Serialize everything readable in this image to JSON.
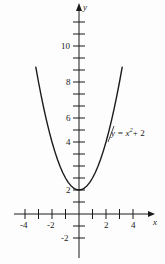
{
  "chart_data": {
    "type": "line",
    "title": "",
    "xlabel": "x",
    "ylabel": "y",
    "equation_label": "y = x",
    "equation_exponent": "2",
    "equation_tail": "+ 2",
    "function": "y = x^2 + 2",
    "xlim": [
      -4.7,
      5.0
    ],
    "ylim": [
      -2.9,
      12.3
    ],
    "x_tick_labels": [
      "-4",
      "-2",
      "2",
      "4"
    ],
    "x_tick_label_values": [
      -4,
      -2,
      2,
      4
    ],
    "x_ticks_all": [
      -4,
      -3,
      -2,
      -1,
      1,
      2,
      3,
      4
    ],
    "y_tick_labels": [
      "-2",
      "2",
      "4",
      "6",
      "8",
      "10"
    ],
    "y_tick_label_values": [
      -2,
      2,
      4,
      6,
      8,
      10
    ],
    "y_ticks_all": [
      -2,
      -1,
      1,
      2,
      3,
      4,
      5,
      6,
      7,
      8,
      9,
      10,
      11,
      12
    ],
    "grid": false,
    "legend": "none",
    "vertex": [
      0,
      2
    ],
    "x": [
      -3.2,
      -3.0,
      -2.8,
      -2.6,
      -2.4,
      -2.2,
      -2.0,
      -1.8,
      -1.6,
      -1.4,
      -1.2,
      -1.0,
      -0.8,
      -0.6,
      -0.4,
      -0.2,
      0.0,
      0.2,
      0.4,
      0.6,
      0.8,
      1.0,
      1.2,
      1.4,
      1.6,
      1.8,
      2.0,
      2.2,
      2.4,
      2.6,
      2.8,
      3.0,
      3.2
    ],
    "y": [
      12.24,
      11.0,
      9.84,
      8.76,
      7.76,
      6.84,
      6.0,
      5.24,
      4.56,
      3.96,
      3.44,
      3.0,
      2.64,
      2.36,
      2.16,
      2.04,
      2.0,
      2.04,
      2.16,
      2.36,
      2.64,
      3.0,
      3.44,
      3.96,
      4.56,
      5.24,
      6.0,
      6.84,
      7.76,
      8.76,
      9.84,
      11.0,
      12.24
    ],
    "axis_color": "#1a1a1a",
    "curve_color": "#1a1a1a",
    "background": "#fdfdfd"
  }
}
